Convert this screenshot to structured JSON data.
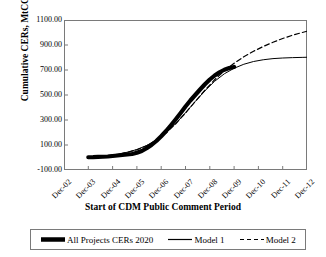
{
  "chart_data": {
    "type": "line",
    "title": "",
    "xlabel": "Start of CDM Public Comment Period",
    "ylabel": "Cumulative CERs, MtCO2e",
    "ylabel_main": "Cumulative CERs, MtCO",
    "ylabel_sub": "2",
    "ylabel_tail": "e",
    "categories": [
      "Dec-02",
      "Dec-03",
      "Dec-04",
      "Dec-05",
      "Dec-06",
      "Dec-07",
      "Dec-08",
      "Dec-09",
      "Dec-10",
      "Dec-11",
      "Dec-12"
    ],
    "yticks": [
      "1100.00",
      "900.00",
      "700.00",
      "500.00",
      "300.00",
      "100.00",
      "-100.00"
    ],
    "ytick_values": [
      1100,
      900,
      700,
      500,
      300,
      100,
      -100
    ],
    "ylim": [
      -100,
      1100
    ],
    "xlim": [
      0,
      10
    ],
    "grid": false,
    "legend_position": "bottom",
    "series": [
      {
        "name": "All Projects CERs 2020",
        "style": "thick-solid",
        "color": "#000000",
        "width": 4.2,
        "x": [
          1.0,
          1.2,
          1.4,
          1.6,
          1.8,
          2.0,
          2.2,
          2.4,
          2.6,
          2.8,
          3.0,
          3.2,
          3.4,
          3.6,
          3.8,
          4.0,
          4.2,
          4.4,
          4.6,
          4.8,
          5.0,
          5.2,
          5.4,
          5.6,
          5.8,
          6.0,
          6.2,
          6.4,
          6.6,
          6.8,
          7.0
        ],
        "values": [
          2,
          3,
          5,
          6,
          8,
          12,
          16,
          20,
          24,
          28,
          38,
          52,
          74,
          100,
          132,
          170,
          212,
          258,
          306,
          356,
          408,
          456,
          500,
          544,
          586,
          624,
          656,
          682,
          702,
          716,
          724
        ]
      },
      {
        "name": "Model 1",
        "style": "thin-solid",
        "color": "#000000",
        "width": 1,
        "x": [
          1.0,
          1.4,
          1.8,
          2.2,
          2.6,
          3.0,
          3.4,
          3.8,
          4.2,
          4.6,
          5.0,
          5.4,
          5.8,
          6.2,
          6.6,
          7.0,
          7.4,
          7.8,
          8.2,
          8.6,
          9.0,
          9.4,
          9.8,
          10.0
        ],
        "values": [
          6,
          10,
          16,
          26,
          42,
          64,
          96,
          140,
          198,
          272,
          358,
          448,
          534,
          610,
          670,
          714,
          746,
          768,
          782,
          791,
          796,
          799,
          801,
          802
        ]
      },
      {
        "name": "Model 2",
        "style": "dashed",
        "color": "#000000",
        "width": 1.2,
        "x": [
          1.0,
          1.4,
          1.8,
          2.2,
          2.6,
          3.0,
          3.4,
          3.8,
          4.2,
          4.6,
          5.0,
          5.4,
          5.8,
          6.2,
          6.6,
          7.0,
          7.4,
          7.8,
          8.2,
          8.6,
          9.0,
          9.4,
          9.8,
          10.0
        ],
        "values": [
          4,
          8,
          14,
          24,
          40,
          62,
          94,
          138,
          196,
          270,
          356,
          448,
          538,
          622,
          694,
          754,
          806,
          850,
          888,
          922,
          952,
          978,
          1000,
          1010
        ]
      }
    ],
    "legend": [
      {
        "label": "All Projects CERs 2020",
        "style": "thick-solid"
      },
      {
        "label": "Model 1",
        "style": "thin-solid"
      },
      {
        "label": "Model 2",
        "style": "dashed"
      }
    ]
  }
}
